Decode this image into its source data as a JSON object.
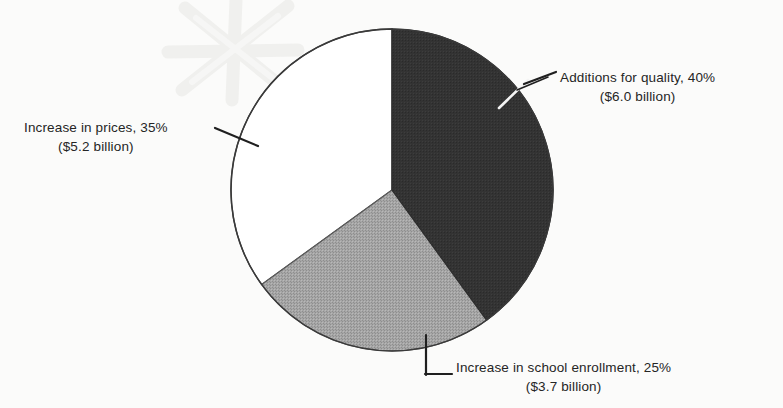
{
  "chart_data": {
    "type": "pie",
    "title": "",
    "subtitle": "",
    "xlabel": "",
    "ylabel": "",
    "legend_position": "callout-labels",
    "grid": false,
    "total_label": "",
    "unit": "billion dollars",
    "categories": [
      "Additions for quality",
      "Increase in school enrollment",
      "Increase in prices"
    ],
    "values": [
      40,
      25,
      35
    ],
    "amounts": [
      6.0,
      3.7,
      5.2
    ],
    "colors": [
      "#333333",
      "#a0a0a0",
      "#ffffff"
    ],
    "slices": [
      {
        "name": "Additions for quality",
        "percent": 40,
        "amount": 6.0,
        "amount_text": "($6.0 billion)",
        "label_text": "Additions for quality, 40%",
        "color": "#333333",
        "start_angle_deg": 0,
        "end_angle_deg": 144
      },
      {
        "name": "Increase in school enrollment",
        "percent": 25,
        "amount": 3.7,
        "amount_text": "($3.7 billion)",
        "label_text": "Increase in school enrollment, 25%",
        "color": "#a0a0a0",
        "start_angle_deg": 144,
        "end_angle_deg": 234
      },
      {
        "name": "Increase in prices",
        "percent": 35,
        "amount": 5.2,
        "amount_text": "($5.2 billion)",
        "label_text": "Increase in prices, 35%",
        "color": "#ffffff",
        "start_angle_deg": 234,
        "end_angle_deg": 360
      }
    ]
  },
  "labels": {
    "additions": {
      "line1": "Additions for quality, 40%",
      "line2": "($6.0 billion)"
    },
    "prices": {
      "line1": "Increase in prices, 35%",
      "line2": "($5.2 billion)"
    },
    "enrollment": {
      "line1": "Increase in school enrollment, 25%",
      "line2": "($3.7 billion)"
    }
  },
  "geometry": {
    "center_x": 392,
    "center_y": 190,
    "radius": 161
  },
  "style": {
    "dark_slice_color": "#333333",
    "gray_slice_color": "#a0a0a0",
    "white_slice_color": "#ffffff",
    "outline_color": "#3a3a3a",
    "text_color": "#252525",
    "background_color": "#fbfbfa",
    "watermark_color": "#f1f1f1"
  }
}
